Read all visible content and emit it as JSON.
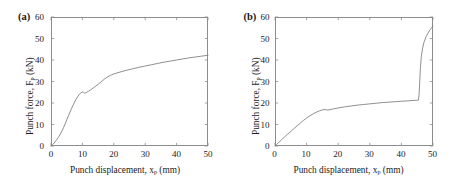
{
  "figure": {
    "background_color": "#ffffff",
    "axis_color": "#8d8d8d",
    "curve_color": "#7b7b7b"
  },
  "panels": [
    {
      "tag": "(a)",
      "xlabel_main": "Punch displacement, x",
      "xlabel_sub": "p",
      "xlabel_unit": " (mm)",
      "ylabel_main": "Punch force, F",
      "ylabel_sub": "p",
      "ylabel_unit": " (kN)",
      "xticks": [
        "0",
        "10",
        "20",
        "30",
        "40",
        "50"
      ],
      "yticks": [
        "0",
        "10",
        "20",
        "30",
        "40",
        "50",
        "60"
      ]
    },
    {
      "tag": "(b)",
      "xlabel_main": "Punch displacement, x",
      "xlabel_sub": "p",
      "xlabel_unit": " (mm)",
      "ylabel_main": "Punch force, F",
      "ylabel_sub": "p",
      "ylabel_unit": " (kN)",
      "xticks": [
        "0",
        "10",
        "20",
        "30",
        "40",
        "50"
      ],
      "yticks": [
        "0",
        "10",
        "20",
        "30",
        "40",
        "50",
        "60"
      ]
    }
  ],
  "chart_data": [
    {
      "type": "line",
      "title": "(a)",
      "xlabel": "Punch displacement, x_p (mm)",
      "ylabel": "Punch force, F_p (kN)",
      "xlim": [
        0,
        50
      ],
      "ylim": [
        0,
        60
      ],
      "xticks": [
        0,
        10,
        20,
        30,
        40,
        50
      ],
      "yticks": [
        0,
        10,
        20,
        30,
        40,
        50,
        60
      ],
      "grid": false,
      "legend": "none",
      "series": [
        {
          "name": "Punch force (a)",
          "x": [
            0,
            0.5,
            1,
            1.5,
            2,
            2.5,
            3,
            3.5,
            4,
            4.5,
            5,
            5.5,
            6,
            6.5,
            7,
            7.5,
            8,
            8.5,
            9,
            9.5,
            10,
            10.3,
            10.6,
            11,
            12,
            13,
            14,
            15,
            16,
            17,
            18,
            19,
            20,
            22,
            24,
            26,
            28,
            30,
            32,
            34,
            36,
            38,
            40,
            42,
            44,
            46,
            48,
            50
          ],
          "y": [
            0,
            0.6,
            1.4,
            2.3,
            3.3,
            4.4,
            5.6,
            7.0,
            8.6,
            10.3,
            12.1,
            13.9,
            15.6,
            17.3,
            18.9,
            20.4,
            21.8,
            23.0,
            24.0,
            24.7,
            25.1,
            25.0,
            24.6,
            24.7,
            25.5,
            26.5,
            27.6,
            28.7,
            29.9,
            31.1,
            32.1,
            32.9,
            33.5,
            34.4,
            35.2,
            35.9,
            36.6,
            37.2,
            37.8,
            38.4,
            39.0,
            39.5,
            40.0,
            40.5,
            41.0,
            41.4,
            41.8,
            42.2
          ]
        }
      ]
    },
    {
      "type": "line",
      "title": "(b)",
      "xlabel": "Punch displacement, x_p (mm)",
      "ylabel": "Punch force, F_p (kN)",
      "xlim": [
        0,
        50
      ],
      "ylim": [
        0,
        60
      ],
      "xticks": [
        0,
        10,
        20,
        30,
        40,
        50
      ],
      "yticks": [
        0,
        10,
        20,
        30,
        40,
        50,
        60
      ],
      "grid": false,
      "legend": "none",
      "series": [
        {
          "name": "Punch force (b)",
          "x": [
            0,
            0.5,
            1,
            2,
            3,
            4,
            5,
            6,
            7,
            8,
            9,
            10,
            11,
            12,
            13,
            14,
            15,
            16,
            16.5,
            17,
            18,
            19,
            20,
            22,
            24,
            26,
            28,
            30,
            32,
            34,
            36,
            38,
            40,
            42,
            44,
            45,
            45.4,
            45.6,
            45.8,
            46.0,
            46.3,
            46.7,
            47.2,
            47.8,
            48.5,
            49.2,
            50
          ],
          "y": [
            0,
            0.7,
            1.4,
            2.8,
            4.2,
            5.5,
            6.8,
            8.1,
            9.4,
            10.7,
            11.9,
            13.0,
            14.0,
            14.9,
            15.7,
            16.3,
            16.8,
            17.0,
            16.7,
            16.8,
            17.1,
            17.4,
            17.7,
            18.2,
            18.6,
            19.0,
            19.3,
            19.6,
            19.9,
            20.2,
            20.4,
            20.6,
            20.8,
            21.0,
            21.2,
            21.3,
            21.3,
            24.0,
            30.0,
            36.0,
            41.5,
            45.5,
            48.5,
            50.8,
            52.7,
            54.3,
            55.8
          ]
        }
      ]
    }
  ]
}
